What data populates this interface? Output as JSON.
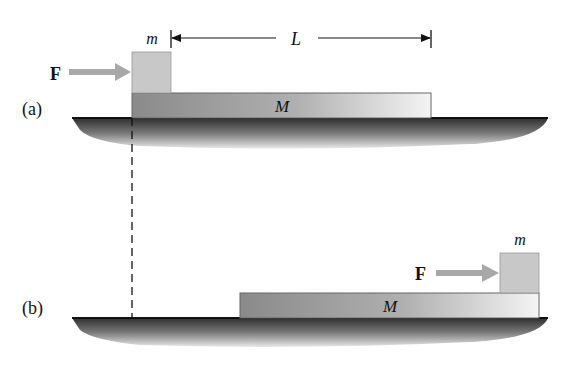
{
  "diagram": {
    "panel_a": {
      "label": "(a)",
      "force_label": "F",
      "small_block_label": "m",
      "large_block_label": "M",
      "length_label": "L"
    },
    "panel_b": {
      "label": "(b)",
      "force_label": "F",
      "small_block_label": "m",
      "large_block_label": "M"
    },
    "colors": {
      "small_block": "#c8c8c8",
      "large_block_dark": "#8a8a8a",
      "large_block_light": "#f2f2f2",
      "ground_dark": "#3a3a3a",
      "arrow_gray": "#a8a8a8",
      "line": "#111111"
    }
  }
}
